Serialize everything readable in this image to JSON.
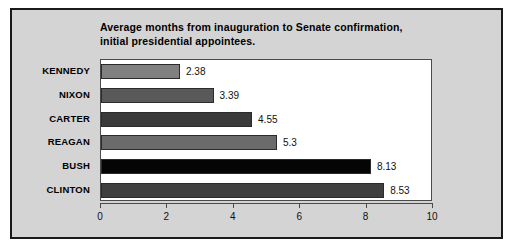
{
  "figure": {
    "background_color": "#d4d4d4",
    "border_color": "#1a1a1a",
    "plot_background_color": "#ffffff"
  },
  "title": {
    "line1": "Average months from inauguration to Senate confirmation,",
    "line2": "initial presidential appointees."
  },
  "chart_data": {
    "type": "bar",
    "orientation": "horizontal",
    "title": "Average months from inauguration to Senate confirmation, initial presidential appointees.",
    "xlabel": "",
    "ylabel": "",
    "xlim": [
      0,
      10
    ],
    "xticks": [
      "0",
      "2",
      "4",
      "6",
      "8",
      "10"
    ],
    "grid": false,
    "legend": "none",
    "categories": [
      "KENNEDY",
      "NIXON",
      "CARTER",
      "REAGAN",
      "BUSH",
      "CLINTON"
    ],
    "values": [
      2.38,
      3.39,
      4.55,
      5.3,
      8.13,
      8.53
    ],
    "value_labels": [
      "2.38",
      "3.39",
      "4.55",
      "5.3",
      "8.13",
      "8.53"
    ],
    "bar_colors": [
      "#808080",
      "#595959",
      "#3a3a3a",
      "#6b6b6b",
      "#050505",
      "#3f3f3f"
    ],
    "bars": [
      {
        "category": "KENNEDY",
        "value": 2.38,
        "label": "2.38",
        "color": "#808080"
      },
      {
        "category": "NIXON",
        "value": 3.39,
        "label": "3.39",
        "color": "#595959"
      },
      {
        "category": "CARTER",
        "value": 4.55,
        "label": "4.55",
        "color": "#3a3a3a"
      },
      {
        "category": "REAGAN",
        "value": 5.3,
        "label": "5.3",
        "color": "#6b6b6b"
      },
      {
        "category": "BUSH",
        "value": 8.13,
        "label": "8.13",
        "color": "#050505"
      },
      {
        "category": "CLINTON",
        "value": 8.53,
        "label": "8.53",
        "color": "#3f3f3f"
      }
    ]
  }
}
